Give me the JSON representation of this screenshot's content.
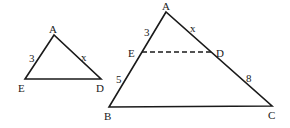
{
  "small_triangle": {
    "vertices": {
      "A": "A",
      "E": "E",
      "D": "D"
    },
    "side_labels": {
      "AE": "3",
      "AD": "x"
    }
  },
  "large_triangle": {
    "vertices": {
      "A": "A",
      "B": "B",
      "C": "C",
      "E": "E",
      "D": "D"
    },
    "side_labels": {
      "AE": "3",
      "EB": "5",
      "AD": "x",
      "DC": "8"
    },
    "segment_ED": "dashed"
  }
}
